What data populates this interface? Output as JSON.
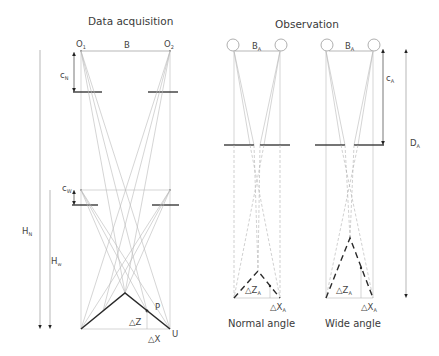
{
  "panels": {
    "acquisition": {
      "title": "Data acquisition",
      "labels": {
        "camera_left": "O",
        "camera_left_sub": "1",
        "camera_right": "O",
        "camera_right_sub": "2",
        "baseline": "B",
        "focal_normal": "c",
        "focal_normal_sub": "N",
        "focal_wide": "c",
        "focal_wide_sub": "W",
        "height_normal": "H",
        "height_normal_sub": "N",
        "height_wide": "H",
        "height_wide_sub": "w",
        "point": "P",
        "corner": "U",
        "delta_z": "△Z",
        "delta_x": "△X"
      }
    },
    "observation": {
      "title": "Observation",
      "normal": {
        "caption": "Normal angle",
        "baseline": "B",
        "baseline_sub": "A",
        "delta_z": "△Z",
        "delta_z_sub": "A",
        "delta_x": "△X",
        "delta_x_sub": "A"
      },
      "wide": {
        "caption": "Wide angle",
        "baseline": "B",
        "baseline_sub": "A",
        "delta_z": "△Z",
        "delta_z_sub": "A",
        "delta_x": "△X",
        "delta_x_sub": "A",
        "focal": "c",
        "focal_sub": "A",
        "distance": "D",
        "distance_sub": "A"
      }
    }
  },
  "colors": {
    "thick_line": "#2a2a2a",
    "thin_line": "#b8b8b8",
    "text": "#3a3a3a"
  }
}
